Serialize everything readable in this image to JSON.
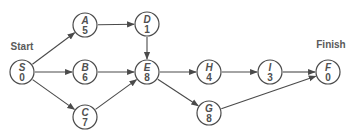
{
  "diagram": {
    "type": "activity-on-node network",
    "labels": {
      "start": "Start",
      "finish": "Finish"
    },
    "colors": {
      "line": "#4a4a4a",
      "text": "#505050",
      "background": "#ffffff"
    },
    "nodes": [
      {
        "id": "S",
        "letter": "S",
        "duration": "0",
        "x": 22,
        "y": 72
      },
      {
        "id": "A",
        "letter": "A",
        "duration": "5",
        "x": 85,
        "y": 25
      },
      {
        "id": "B",
        "letter": "B",
        "duration": "6",
        "x": 85,
        "y": 72
      },
      {
        "id": "C",
        "letter": "C",
        "duration": "7",
        "x": 85,
        "y": 117
      },
      {
        "id": "D",
        "letter": "D",
        "duration": "1",
        "x": 147,
        "y": 24
      },
      {
        "id": "E",
        "letter": "E",
        "duration": "8",
        "x": 147,
        "y": 72
      },
      {
        "id": "H",
        "letter": "H",
        "duration": "4",
        "x": 209,
        "y": 72
      },
      {
        "id": "G",
        "letter": "G",
        "duration": "8",
        "x": 209,
        "y": 113
      },
      {
        "id": "I",
        "letter": "I",
        "duration": "3",
        "x": 270,
        "y": 72
      },
      {
        "id": "F",
        "letter": "F",
        "duration": "0",
        "x": 328,
        "y": 72
      }
    ],
    "edges": [
      {
        "from": "S",
        "to": "A"
      },
      {
        "from": "S",
        "to": "B"
      },
      {
        "from": "S",
        "to": "C"
      },
      {
        "from": "A",
        "to": "D"
      },
      {
        "from": "D",
        "to": "E"
      },
      {
        "from": "B",
        "to": "E"
      },
      {
        "from": "C",
        "to": "E"
      },
      {
        "from": "E",
        "to": "H"
      },
      {
        "from": "E",
        "to": "G"
      },
      {
        "from": "H",
        "to": "I"
      },
      {
        "from": "I",
        "to": "F"
      },
      {
        "from": "G",
        "to": "F"
      }
    ]
  }
}
